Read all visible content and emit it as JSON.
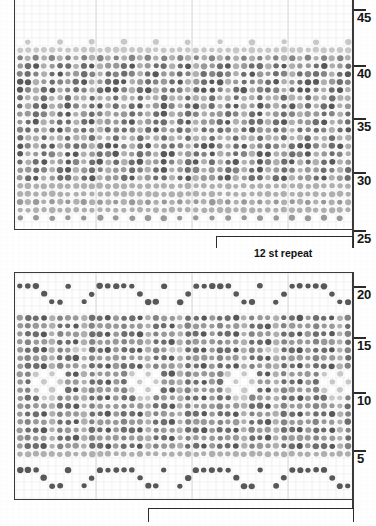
{
  "chart_data": {
    "type": "heatmap",
    "title": "",
    "subtitle": "",
    "xlabel": "",
    "ylabel": "",
    "grid": true,
    "legend_position": "none",
    "columns": 42,
    "cell_size_px": 8,
    "shade_levels": [
      "#ffffff",
      "#c9c9c9",
      "#b0b0b0",
      "#9a9a9a",
      "#858585",
      "#6e6e6e",
      "#585858"
    ],
    "panels": [
      {
        "name": "upper-chart",
        "row_label_values": [
          45,
          40,
          35,
          30,
          25
        ],
        "row_range": [
          25,
          45
        ],
        "rows": 21,
        "repeat_label": "12 st repeat",
        "repeat_stitches": 12
      },
      {
        "name": "lower-chart",
        "row_label_values": [
          20,
          15,
          10,
          5
        ],
        "row_range": [
          1,
          21
        ],
        "rows": 21,
        "repeat_label": "",
        "repeat_stitches": 12
      }
    ]
  },
  "upper_panel": {
    "name": "upper-chart",
    "row_labels": [
      "45",
      "40",
      "35",
      "30",
      "25"
    ],
    "repeat": {
      "label": "12 st repeat",
      "stitches": "12"
    }
  },
  "lower_panel": {
    "name": "lower-chart",
    "row_labels": [
      "20",
      "15",
      "10",
      "5"
    ],
    "repeat": {
      "label": "",
      "stitches": "12"
    }
  },
  "colors": {
    "frame": "#3a3a3a",
    "grid": "#e4e4e4",
    "text": "#161616",
    "background": "#ffffff"
  }
}
